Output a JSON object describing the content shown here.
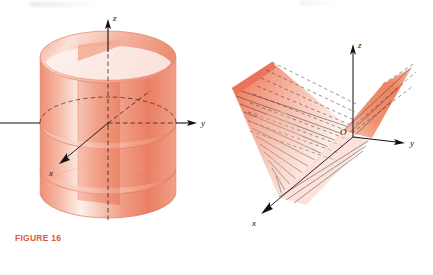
{
  "page": {
    "background": "#ffffff",
    "width": 433,
    "height": 275,
    "caption_color": "#e2573d",
    "surface_color": "#ef8a72",
    "axis_color": "#14110f"
  },
  "figures": [
    {
      "id": "figure-16",
      "caption": "FIGURE 16",
      "description": "Right circular cylinder with vertical cutting plane, elliptical cross-sections shown",
      "shape": "cylinder",
      "axes": [
        {
          "name": "z",
          "label": "z",
          "direction": "up",
          "style": "solid-arrow"
        },
        {
          "name": "y",
          "label": "y",
          "direction": "right",
          "style": "solid-arrow"
        },
        {
          "name": "x",
          "label": "x",
          "direction": "down-left",
          "style": "solid-arrow"
        }
      ],
      "hidden_lines": "dashed",
      "colors": {
        "fill_light": "#fbd9cf",
        "fill_mid": "#f2a48e",
        "fill_dark": "#e8806a",
        "edge": "#e0715a"
      }
    },
    {
      "id": "figure-17",
      "caption": "FIGURE 17",
      "description": "Ruled hyperbolic paraboloid surface z = y^2 - x^2 style saddle with straight-line rulings",
      "shape": "ruled-surface",
      "axes": [
        {
          "name": "z",
          "label": "z",
          "direction": "up",
          "style": "solid-arrow"
        },
        {
          "name": "y",
          "label": "y",
          "direction": "right",
          "style": "solid-arrow"
        },
        {
          "name": "x",
          "label": "x",
          "direction": "down-left",
          "style": "solid-arrow"
        }
      ],
      "origin_label": "O",
      "ruling_count": 14,
      "hidden_lines": "dashed",
      "colors": {
        "fill_light": "#fdeae3",
        "fill_mid": "#f3a18a",
        "fill_dark": "#ec7c62",
        "edge": "#e5664c",
        "ruling": "#3a3330"
      }
    }
  ]
}
